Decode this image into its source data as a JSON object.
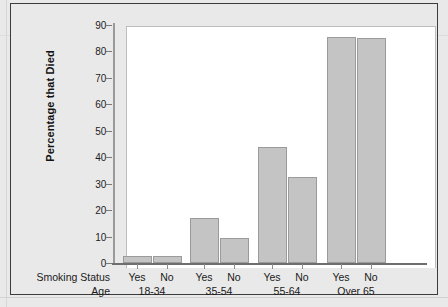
{
  "chart_data": {
    "type": "bar",
    "title": "",
    "xlabel": "",
    "ylabel": "Percentage that Died",
    "ylim": [
      0,
      90
    ],
    "yticks": [
      0,
      10,
      20,
      30,
      40,
      50,
      60,
      70,
      80,
      90
    ],
    "grid": false,
    "legend": "none",
    "group_axis_titles": {
      "smoking_status": "Smoking Status",
      "age": "Age"
    },
    "categories": [
      "18-34",
      "35-54",
      "55-64",
      "Over 65"
    ],
    "subcategories": [
      "Yes",
      "No"
    ],
    "series": [
      {
        "name": "Yes",
        "values": [
          2.8,
          17.0,
          44.0,
          85.5
        ]
      },
      {
        "name": "No",
        "values": [
          2.8,
          9.5,
          32.5,
          85.0
        ]
      }
    ],
    "groups": [
      {
        "age": "18-34",
        "bars": [
          {
            "smoking": "Yes",
            "value": 2.8
          },
          {
            "smoking": "No",
            "value": 2.8
          }
        ]
      },
      {
        "age": "35-54",
        "bars": [
          {
            "smoking": "Yes",
            "value": 17.0
          },
          {
            "smoking": "No",
            "value": 9.5
          }
        ]
      },
      {
        "age": "55-64",
        "bars": [
          {
            "smoking": "Yes",
            "value": 44.0
          },
          {
            "smoking": "No",
            "value": 32.5
          }
        ]
      },
      {
        "age": "Over 65",
        "bars": [
          {
            "smoking": "Yes",
            "value": 85.5
          },
          {
            "smoking": "No",
            "value": 85.0
          }
        ]
      }
    ],
    "colors": {
      "bar_fill": "#c4c4c4",
      "bar_stroke": "#9b9b9b",
      "plot_background": "#ffffff",
      "figure_background": "#e9e9e9",
      "frame": "#3c3c3c",
      "axis": "#6e6e6e",
      "text": "#1a1a1a"
    }
  }
}
